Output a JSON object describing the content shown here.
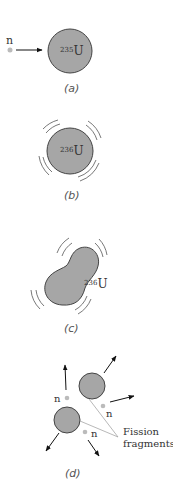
{
  "figure": {
    "panels": [
      {
        "id": "a",
        "caption": "(a)",
        "neutron_label": "n",
        "nucleus": {
          "mass_number": "235",
          "element": "U"
        }
      },
      {
        "id": "b",
        "caption": "(b)",
        "nucleus": {
          "mass_number": "236",
          "element": "U"
        }
      },
      {
        "id": "c",
        "caption": "(c)",
        "nucleus": {
          "mass_number": "236",
          "element": "U"
        }
      },
      {
        "id": "d",
        "caption": "(d)",
        "neutron_labels": [
          "n",
          "n",
          "n"
        ],
        "fragments_label_line1": "Fission",
        "fragments_label_line2": "fragments"
      }
    ],
    "colors": {
      "nucleus_fill": "#a6a6a6",
      "nucleus_stroke": "#444444",
      "neutron_fill": "#bbbbbb",
      "arrow": "#111111"
    }
  }
}
